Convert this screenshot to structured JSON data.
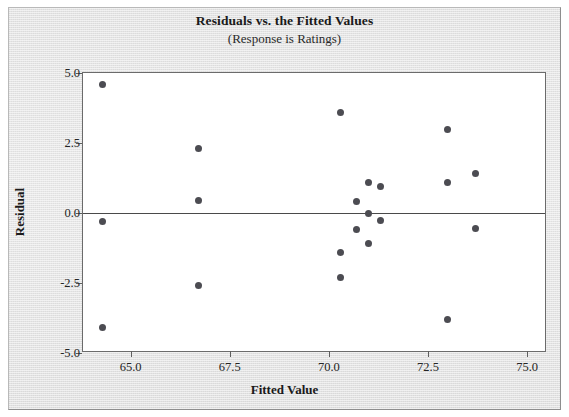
{
  "chart_data": {
    "type": "scatter",
    "title": "Residuals vs. the Fitted Values",
    "subtitle": "(Response is Ratings)",
    "xlabel": "Fitted Value",
    "ylabel": "Residual",
    "xlim": [
      63.8,
      75.5
    ],
    "ylim": [
      -5.0,
      5.0
    ],
    "xticks": [
      "65.0",
      "67.5",
      "70.0",
      "72.5",
      "75.0"
    ],
    "xtick_values": [
      65.0,
      67.5,
      70.0,
      72.5,
      75.0
    ],
    "yticks": [
      "5.0",
      "2.5",
      "0.0",
      "-2.5",
      "-5.0"
    ],
    "ytick_values": [
      5.0,
      2.5,
      0.0,
      -2.5,
      -5.0
    ],
    "grid": false,
    "legend": "none",
    "reference_line": {
      "orientation": "horizontal",
      "y": 0.0
    },
    "marker": {
      "shape": "circle",
      "color": "#4c4c52",
      "size": 7
    },
    "points": [
      {
        "x": 64.3,
        "y": 4.6
      },
      {
        "x": 64.3,
        "y": -0.3
      },
      {
        "x": 64.3,
        "y": -4.1
      },
      {
        "x": 66.7,
        "y": 2.3
      },
      {
        "x": 66.7,
        "y": 0.45
      },
      {
        "x": 66.7,
        "y": -2.6
      },
      {
        "x": 70.3,
        "y": 3.6
      },
      {
        "x": 70.3,
        "y": -1.4
      },
      {
        "x": 70.3,
        "y": -2.3
      },
      {
        "x": 70.7,
        "y": 0.4
      },
      {
        "x": 70.7,
        "y": -0.6
      },
      {
        "x": 71.0,
        "y": 1.1
      },
      {
        "x": 71.0,
        "y": 0.0
      },
      {
        "x": 71.0,
        "y": -1.1
      },
      {
        "x": 71.3,
        "y": 0.95
      },
      {
        "x": 71.3,
        "y": -0.25
      },
      {
        "x": 73.0,
        "y": 3.0
      },
      {
        "x": 73.0,
        "y": 1.1
      },
      {
        "x": 73.0,
        "y": -3.8
      },
      {
        "x": 73.7,
        "y": 1.4
      },
      {
        "x": 73.7,
        "y": -0.55
      }
    ]
  }
}
